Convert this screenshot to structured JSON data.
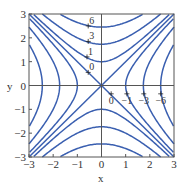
{
  "chart_data": {
    "type": "contour",
    "title": "",
    "xlabel": "x",
    "ylabel": "y",
    "xlim": [
      -3,
      3
    ],
    "ylim": [
      -3,
      3
    ],
    "xticks": [
      "-3",
      "-2",
      "-1",
      "0",
      "1",
      "2",
      "3"
    ],
    "yticks": [
      "-3",
      "-2",
      "-1",
      "0",
      "1",
      "2",
      "3"
    ],
    "function": "y^2 - x^2",
    "levels": [
      -6,
      -3,
      -1,
      0,
      1,
      3,
      6
    ],
    "level_labels": [
      {
        "text": "6",
        "x": -0.55,
        "y": 2.5
      },
      {
        "text": "3",
        "x": -0.55,
        "y": 1.85
      },
      {
        "text": "1",
        "x": -0.6,
        "y": 1.2
      },
      {
        "text": "0",
        "x": -0.55,
        "y": 0.55
      },
      {
        "text": "0",
        "x": 0.4,
        "y": -0.35
      },
      {
        "text": "-1",
        "x": 1.05,
        "y": -0.35
      },
      {
        "text": "-3",
        "x": 1.75,
        "y": -0.35
      },
      {
        "text": "-6",
        "x": 2.45,
        "y": -0.35
      }
    ],
    "axis_lines": {
      "x0": true,
      "y0": true
    },
    "grid": false,
    "legend": null
  },
  "style": {
    "contour_color": "#3a5fb0",
    "axis_color": "#555555"
  }
}
